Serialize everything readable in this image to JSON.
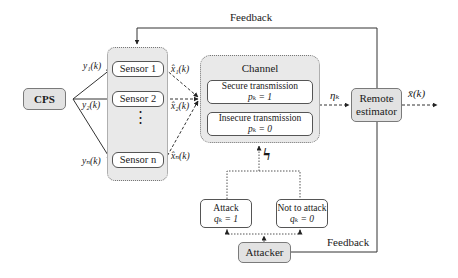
{
  "diagram": {
    "cps": {
      "label": "CPS"
    },
    "sensors": [
      {
        "label": "Sensor 1",
        "input": "y₁(k)",
        "output": "x̂₁(k)"
      },
      {
        "label": "Sensor 2",
        "input": "y₂(k)",
        "output": "x̂₂(k)"
      },
      {
        "label": "Sensor n",
        "input": "yₙ(k)",
        "output": "x̂ₙ(k)"
      }
    ],
    "sensor_ellipsis": "⋮",
    "channel": {
      "title": "Channel",
      "secure": {
        "label": "Secure transmission",
        "value": "pₖ = 1"
      },
      "insecure": {
        "label": "Insecure transmission",
        "value": "pₖ = 0"
      }
    },
    "eta": "ηₖ",
    "remote_estimator": {
      "line1": "Remote",
      "line2": "estimator"
    },
    "output": "x̄(k)",
    "attack": {
      "label": "Attack",
      "value": "qₖ = 1"
    },
    "no_attack": {
      "label": "Not to attack",
      "value": "qₖ = 0"
    },
    "attacker": {
      "label": "Attacker"
    },
    "feedback_top": "Feedback",
    "feedback_bottom": "Feedback",
    "lightning": "ϟ",
    "colors": {
      "box_gray": "#e2e2e2",
      "line": "#333333",
      "panel": "#e9e9e9"
    }
  }
}
